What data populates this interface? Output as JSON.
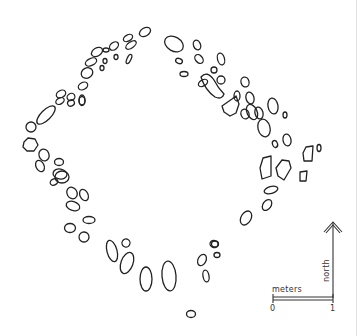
{
  "figure": {
    "type": "archaeological site plan (stone circle / enclosure outline)",
    "stone_outline_color": "#222222"
  },
  "scale_bar": {
    "unit_label": "meters",
    "start_tick": "0",
    "end_tick": "1"
  },
  "north_arrow": {
    "label": "north"
  }
}
